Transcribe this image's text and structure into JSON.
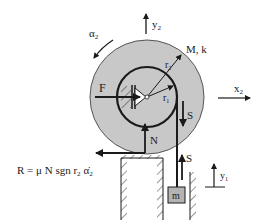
{
  "diagram": {
    "colors": {
      "disk_fill": "#c8c8c8",
      "mass_fill": "#b4b4b4",
      "line": "#1a1a1a",
      "background": "#ffffff"
    },
    "labels": {
      "y2": "y",
      "y2_sub": "2",
      "x2": "x",
      "x2_sub": "2",
      "alpha2": "α",
      "alpha2_sub": "2",
      "mass_props": "M, k",
      "r2": "r",
      "r2_sub": "2",
      "r1": "r",
      "r1_sub": "1",
      "force_F": "F",
      "force_S_top": "S",
      "force_S_bottom": "S",
      "force_N": "N",
      "mass_m": "m",
      "y1": "y",
      "y1_sub": "1"
    },
    "formula": {
      "text": "R = μ N sgn r",
      "r_sub": "2",
      "alpha": "α̇",
      "alpha_sub": "2"
    }
  }
}
